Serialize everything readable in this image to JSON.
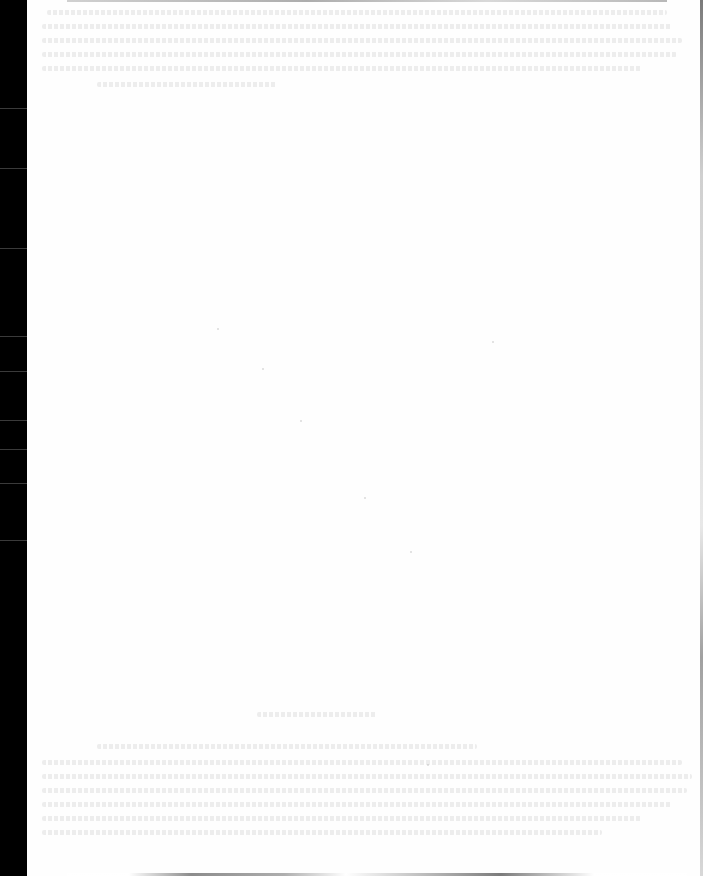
{
  "document": {
    "type": "scanned-blank-page",
    "visible_text": "",
    "note": ""
  },
  "colors": {
    "page": "#fefefe",
    "scanner_border": "#000000",
    "bleed_through": "#a0a0a0"
  },
  "bleed_through": {
    "top_lines": [
      {
        "x": 20,
        "y": 10,
        "w": 620
      },
      {
        "x": 15,
        "y": 24,
        "w": 630
      },
      {
        "x": 15,
        "y": 38,
        "w": 640
      },
      {
        "x": 15,
        "y": 52,
        "w": 635
      },
      {
        "x": 15,
        "y": 66,
        "w": 600
      },
      {
        "x": 70,
        "y": 82,
        "w": 180
      }
    ],
    "bottom_lines": [
      {
        "x": 230,
        "y": 712,
        "w": 120
      },
      {
        "x": 70,
        "y": 744,
        "w": 380
      },
      {
        "x": 15,
        "y": 760,
        "w": 640
      },
      {
        "x": 15,
        "y": 774,
        "w": 650
      },
      {
        "x": 15,
        "y": 788,
        "w": 645
      },
      {
        "x": 15,
        "y": 802,
        "w": 630
      },
      {
        "x": 15,
        "y": 816,
        "w": 600
      },
      {
        "x": 15,
        "y": 830,
        "w": 560
      }
    ]
  }
}
